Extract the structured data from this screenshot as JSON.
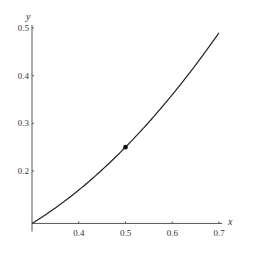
{
  "chart_data": {
    "type": "line",
    "title": "",
    "xlabel": "x",
    "ylabel": "y",
    "xlim": [
      0.3,
      0.7
    ],
    "ylim": [
      0.09,
      0.5
    ],
    "x_ticks": [
      0.4,
      0.5,
      0.6,
      0.7
    ],
    "x_tick_labels": [
      "0.4",
      "0.5",
      "0.6",
      "0.7"
    ],
    "y_ticks": [
      0.2,
      0.3,
      0.4,
      0.5
    ],
    "y_tick_labels": [
      "0.2",
      "0.3",
      "0.4",
      "0.5"
    ],
    "grid": false,
    "legend": null,
    "series": [
      {
        "name": "y = x^2",
        "x": [
          0.3,
          0.35,
          0.4,
          0.45,
          0.5,
          0.55,
          0.6,
          0.65,
          0.7
        ],
        "values": [
          0.09,
          0.1225,
          0.16,
          0.2025,
          0.25,
          0.3025,
          0.36,
          0.4225,
          0.49
        ],
        "color": "#222222"
      }
    ],
    "points": [
      {
        "x": 0.5,
        "y": 0.25,
        "color": "#111111"
      }
    ]
  },
  "colors": {
    "axis": "#555555",
    "curve": "#222222",
    "point": "#111111"
  }
}
